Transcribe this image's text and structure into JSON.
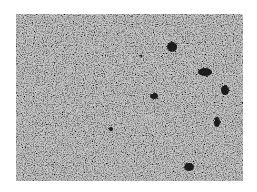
{
  "image": {
    "kind": "grayscale speckled micrograph-like texture",
    "frame": {
      "x": 16,
      "y": 14,
      "width": 227,
      "height": 167
    },
    "background_color": "#ffffff",
    "texture_base_color": "#c9c9c9",
    "blob_color": "#1c1c1c",
    "dark_spots": [
      {
        "cx": 172,
        "cy": 47,
        "rx": 5,
        "ry": 5
      },
      {
        "cx": 205,
        "cy": 72,
        "rx": 7,
        "ry": 4
      },
      {
        "cx": 225,
        "cy": 90,
        "rx": 4,
        "ry": 5
      },
      {
        "cx": 154,
        "cy": 96,
        "rx": 4,
        "ry": 3
      },
      {
        "cx": 217,
        "cy": 122,
        "rx": 3,
        "ry": 5
      },
      {
        "cx": 189,
        "cy": 167,
        "rx": 5,
        "ry": 4
      },
      {
        "cx": 111,
        "cy": 129,
        "rx": 2,
        "ry": 2
      },
      {
        "cx": 141,
        "cy": 56,
        "rx": 1.5,
        "ry": 1.5
      }
    ]
  }
}
